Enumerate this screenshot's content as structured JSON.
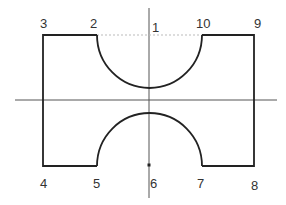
{
  "diagram": {
    "type": "profile-outline",
    "colors": {
      "outline": "#222222",
      "axis": "#555555",
      "dotted": "#bbbbbb",
      "label": "#333333",
      "background": "#ffffff"
    },
    "axes": {
      "horizontal": {
        "x1": 15,
        "y": 100,
        "x2": 277
      },
      "vertical": {
        "x": 149,
        "y1": 8,
        "y2": 198
      }
    },
    "dotted_line": {
      "x1": 97,
      "x2": 202,
      "y": 35
    },
    "marker_dot": {
      "x": 149,
      "y": 165
    },
    "points": [
      {
        "id": "1",
        "label": "1",
        "x": 155,
        "y": 28
      },
      {
        "id": "2",
        "label": "2",
        "x": 92,
        "y": 24
      },
      {
        "id": "3",
        "label": "3",
        "x": 40,
        "y": 24
      },
      {
        "id": "4",
        "label": "4",
        "x": 40,
        "y": 186
      },
      {
        "id": "5",
        "label": "5",
        "x": 94,
        "y": 186
      },
      {
        "id": "6",
        "label": "6",
        "x": 151,
        "y": 187
      },
      {
        "id": "7",
        "label": "7",
        "x": 197,
        "y": 186
      },
      {
        "id": "8",
        "label": "8",
        "x": 252,
        "y": 188
      },
      {
        "id": "9",
        "label": "9",
        "x": 254,
        "y": 24
      },
      {
        "id": "10",
        "label": "10",
        "x": 196,
        "y": 24
      }
    ]
  }
}
